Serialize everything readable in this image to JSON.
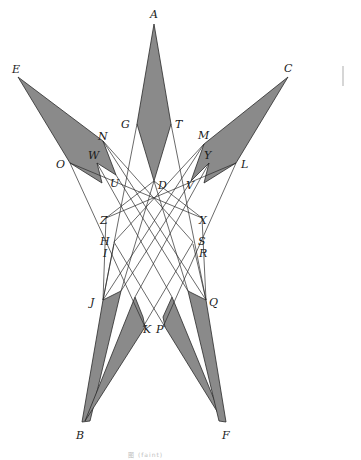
{
  "figure": {
    "caption": "图 (faint)",
    "colors": {
      "shade": "#8a8a8a",
      "line": "#2a2a2a",
      "background": "#ffffff"
    },
    "points": {
      "A": {
        "label": "A",
        "x": 154,
        "y": 24
      },
      "E": {
        "label": "E",
        "x": 18,
        "y": 77
      },
      "C": {
        "label": "C",
        "x": 288,
        "y": 77
      },
      "G": {
        "label": "G",
        "x": 137,
        "y": 124
      },
      "T": {
        "label": "T",
        "x": 171,
        "y": 124
      },
      "N": {
        "label": "N",
        "x": 103,
        "y": 141
      },
      "M": {
        "label": "M",
        "x": 204,
        "y": 144
      },
      "W": {
        "label": "W",
        "x": 97,
        "y": 163
      },
      "Y": {
        "label": "Y",
        "x": 200,
        "y": 163
      },
      "O": {
        "label": "O",
        "x": 70,
        "y": 163
      },
      "L": {
        "label": "L",
        "x": 236,
        "y": 163
      },
      "U": {
        "label": "U",
        "x": 116,
        "y": 175
      },
      "D": {
        "label": "D",
        "x": 154,
        "y": 181
      },
      "V": {
        "label": "V",
        "x": 191,
        "y": 181
      },
      "Z": {
        "label": "Z",
        "x": 106,
        "y": 218
      },
      "X": {
        "label": "X",
        "x": 202,
        "y": 218
      },
      "H": {
        "label": "H",
        "x": 114,
        "y": 240
      },
      "I": {
        "label": "I",
        "x": 114,
        "y": 244
      },
      "S": {
        "label": "S",
        "x": 193,
        "y": 240
      },
      "R": {
        "label": "R",
        "x": 193,
        "y": 244
      },
      "J": {
        "label": "J",
        "x": 103,
        "y": 300
      },
      "Q": {
        "label": "Q",
        "x": 206,
        "y": 300
      },
      "K": {
        "label": "K",
        "x": 143,
        "y": 327
      },
      "P": {
        "label": "P",
        "x": 165,
        "y": 327
      },
      "B": {
        "label": "B",
        "x": 82,
        "y": 422
      },
      "F": {
        "label": "F",
        "x": 226,
        "y": 422
      }
    },
    "labels": [
      {
        "text": "A",
        "x": 150,
        "y": 18
      },
      {
        "text": "E",
        "x": 12,
        "y": 73
      },
      {
        "text": "C",
        "x": 284,
        "y": 72
      },
      {
        "text": "G",
        "x": 121,
        "y": 128
      },
      {
        "text": "T",
        "x": 175,
        "y": 128
      },
      {
        "text": "N",
        "x": 98,
        "y": 140
      },
      {
        "text": "M",
        "x": 198,
        "y": 139
      },
      {
        "text": "W",
        "x": 88,
        "y": 159
      },
      {
        "text": "Y",
        "x": 204,
        "y": 159
      },
      {
        "text": "O",
        "x": 56,
        "y": 168
      },
      {
        "text": "L",
        "x": 241,
        "y": 168
      },
      {
        "text": "U",
        "x": 110,
        "y": 187
      },
      {
        "text": "D",
        "x": 158,
        "y": 189
      },
      {
        "text": "V",
        "x": 186,
        "y": 189
      },
      {
        "text": "Z",
        "x": 100,
        "y": 224
      },
      {
        "text": "X",
        "x": 199,
        "y": 224
      },
      {
        "text": "H",
        "x": 100,
        "y": 245
      },
      {
        "text": "I",
        "x": 103,
        "y": 257
      },
      {
        "text": "S",
        "x": 198,
        "y": 245
      },
      {
        "text": "R",
        "x": 199,
        "y": 257
      },
      {
        "text": "J",
        "x": 90,
        "y": 306
      },
      {
        "text": "Q",
        "x": 209,
        "y": 306
      },
      {
        "text": "K",
        "x": 143,
        "y": 333
      },
      {
        "text": "P",
        "x": 156,
        "y": 333
      },
      {
        "text": "B",
        "x": 76,
        "y": 439
      },
      {
        "text": "F",
        "x": 222,
        "y": 439
      }
    ]
  }
}
